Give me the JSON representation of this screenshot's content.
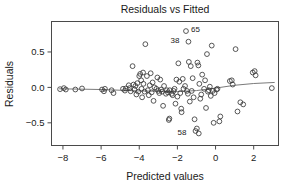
{
  "chart_data": {
    "type": "scatter",
    "title": "Residuals vs Fitted",
    "xlabel": "Predicted values",
    "ylabel": "Residuals",
    "xlim": [
      -8.6,
      3.3
    ],
    "ylim": [
      -0.82,
      0.93
    ],
    "xticks": [
      -8,
      -6,
      -4,
      -2,
      0,
      2
    ],
    "xticklabels": [
      "−8",
      "−6",
      "−4",
      "−2",
      "0",
      "2"
    ],
    "yticks": [
      -0.5,
      0.0,
      0.5
    ],
    "yticklabels": [
      "−0.5",
      "0.0",
      "0.5"
    ],
    "grid": false,
    "legend": null,
    "marker": "open-circle",
    "reference_line": {
      "type": "lowess-smoother",
      "points": [
        [
          -8.2,
          -0.02
        ],
        [
          -7.0,
          -0.025
        ],
        [
          -6.0,
          -0.03
        ],
        [
          -5.0,
          -0.04
        ],
        [
          -4.0,
          -0.05
        ],
        [
          -3.0,
          -0.055
        ],
        [
          -2.0,
          -0.06
        ],
        [
          -1.0,
          -0.045
        ],
        [
          0.0,
          -0.01
        ],
        [
          1.0,
          0.03
        ],
        [
          2.0,
          0.055
        ],
        [
          3.1,
          0.07
        ]
      ]
    },
    "annotations": [
      {
        "label": "65",
        "x": -1.55,
        "y": 0.795,
        "text_dx": 5,
        "text_dy": 1
      },
      {
        "label": "38",
        "x": -1.42,
        "y": 0.645,
        "text_dx": -9,
        "text_dy": 1
      },
      {
        "label": "58",
        "x": -1.05,
        "y": -0.615,
        "text_dx": -9,
        "text_dy": 4
      }
    ],
    "points": [
      [
        -8.15,
        -0.025
      ],
      [
        -7.95,
        -0.01
      ],
      [
        -7.85,
        -0.03
      ],
      [
        -7.35,
        -0.03
      ],
      [
        -7.0,
        -0.015
      ],
      [
        -5.95,
        -0.03
      ],
      [
        -5.85,
        -0.055
      ],
      [
        -5.8,
        -0.02
      ],
      [
        -5.45,
        -0.04
      ],
      [
        -5.35,
        -0.08
      ],
      [
        -4.85,
        -0.02
      ],
      [
        -4.75,
        -0.045
      ],
      [
        -4.7,
        -0.015
      ],
      [
        -4.55,
        0.03
      ],
      [
        -4.5,
        -0.01
      ],
      [
        -4.45,
        -0.055
      ],
      [
        -4.35,
        0.3
      ],
      [
        -4.3,
        0.04
      ],
      [
        -4.25,
        -0.03
      ],
      [
        -4.2,
        0.02
      ],
      [
        -4.15,
        -0.1
      ],
      [
        -4.1,
        0.06
      ],
      [
        -4.05,
        -0.06
      ],
      [
        -4.0,
        0.16
      ],
      [
        -3.95,
        0.19
      ],
      [
        -3.9,
        0.1
      ],
      [
        -3.88,
        -0.02
      ],
      [
        -3.85,
        -0.14
      ],
      [
        -3.8,
        0.21
      ],
      [
        -3.78,
        0.05
      ],
      [
        -3.72,
        -0.06
      ],
      [
        -3.68,
        0.61
      ],
      [
        -3.6,
        0.16
      ],
      [
        -3.55,
        -0.04
      ],
      [
        -3.5,
        -0.11
      ],
      [
        -3.45,
        0.03
      ],
      [
        -3.4,
        0.2
      ],
      [
        -3.35,
        -0.07
      ],
      [
        -3.3,
        0.07
      ],
      [
        -3.25,
        -0.19
      ],
      [
        -3.2,
        0.0
      ],
      [
        -3.1,
        -0.02
      ],
      [
        -3.05,
        0.14
      ],
      [
        -3.0,
        -0.05
      ],
      [
        -2.95,
        -0.08
      ],
      [
        -2.9,
        0.11
      ],
      [
        -2.85,
        -0.03
      ],
      [
        -2.8,
        -0.06
      ],
      [
        -2.75,
        -0.26
      ],
      [
        -2.7,
        0.02
      ],
      [
        -2.6,
        -0.09
      ],
      [
        -2.55,
        -0.04
      ],
      [
        -2.5,
        -0.07
      ],
      [
        -2.45,
        -0.46
      ],
      [
        -2.42,
        -0.44
      ],
      [
        -2.4,
        -0.04
      ],
      [
        -2.3,
        -0.09
      ],
      [
        -2.25,
        -0.11
      ],
      [
        -2.2,
        -0.05
      ],
      [
        -2.15,
        -0.02
      ],
      [
        -2.1,
        -0.23
      ],
      [
        -2.05,
        0.11
      ],
      [
        -2.0,
        -0.13
      ],
      [
        -1.95,
        0.34
      ],
      [
        -1.9,
        0.08
      ],
      [
        -1.85,
        -0.08
      ],
      [
        -1.8,
        -0.3
      ],
      [
        -1.78,
        -0.35
      ],
      [
        -1.72,
        0.12
      ],
      [
        -1.68,
        -0.02
      ],
      [
        -1.6,
        0.02
      ],
      [
        -1.55,
        0.795
      ],
      [
        -1.5,
        -0.05
      ],
      [
        -1.45,
        -0.09
      ],
      [
        -1.42,
        0.645
      ],
      [
        -1.4,
        0.36
      ],
      [
        -1.35,
        -0.2
      ],
      [
        -1.3,
        0.3
      ],
      [
        -1.25,
        -0.05
      ],
      [
        -1.2,
        0.13
      ],
      [
        -1.15,
        -0.14
      ],
      [
        -1.1,
        -0.45
      ],
      [
        -1.05,
        -0.615
      ],
      [
        -0.98,
        -0.58
      ],
      [
        -0.95,
        0.35
      ],
      [
        -0.9,
        0.31
      ],
      [
        -0.88,
        -0.65
      ],
      [
        -0.85,
        0.05
      ],
      [
        -0.8,
        -0.16
      ],
      [
        -0.75,
        -0.1
      ],
      [
        -0.7,
        0.18
      ],
      [
        -0.6,
        -0.02
      ],
      [
        -0.55,
        0.1
      ],
      [
        -0.5,
        -0.29
      ],
      [
        -0.45,
        0.47
      ],
      [
        -0.4,
        -0.06
      ],
      [
        -0.35,
        -0.04
      ],
      [
        -0.3,
        0.01
      ],
      [
        -0.25,
        -0.12
      ],
      [
        -0.2,
        0.59
      ],
      [
        -0.15,
        -0.05
      ],
      [
        -0.1,
        -0.5
      ],
      [
        -0.05,
        -0.08
      ],
      [
        0.05,
        -0.03
      ],
      [
        0.1,
        -0.02
      ],
      [
        0.2,
        -0.48
      ],
      [
        0.25,
        -0.41
      ],
      [
        0.75,
        0.09
      ],
      [
        0.85,
        0.1
      ],
      [
        0.9,
        0.04
      ],
      [
        1.05,
        0.54
      ],
      [
        1.15,
        -0.34
      ],
      [
        1.3,
        -0.21
      ],
      [
        1.45,
        -0.24
      ],
      [
        1.95,
        0.21
      ],
      [
        2.05,
        0.23
      ],
      [
        2.1,
        0.17
      ],
      [
        2.95,
        -0.01
      ]
    ]
  }
}
